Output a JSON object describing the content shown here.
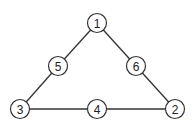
{
  "diagram": {
    "type": "graph",
    "nodes": [
      {
        "id": "1",
        "label": "1",
        "x": 97,
        "y": 23
      },
      {
        "id": "5",
        "label": "5",
        "x": 58,
        "y": 66
      },
      {
        "id": "6",
        "label": "6",
        "x": 136,
        "y": 66
      },
      {
        "id": "3",
        "label": "3",
        "x": 20,
        "y": 109
      },
      {
        "id": "4",
        "label": "4",
        "x": 97,
        "y": 109
      },
      {
        "id": "2",
        "label": "2",
        "x": 175,
        "y": 109
      }
    ],
    "edges": [
      [
        "1",
        "5"
      ],
      [
        "5",
        "3"
      ],
      [
        "3",
        "4"
      ],
      [
        "4",
        "2"
      ],
      [
        "2",
        "6"
      ],
      [
        "6",
        "1"
      ]
    ]
  }
}
